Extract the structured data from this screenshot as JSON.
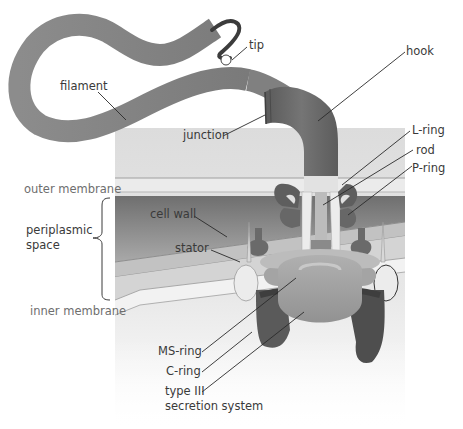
{
  "diagram": {
    "colors": {
      "background": "#ffffff",
      "panel_top": "#d8d8d8",
      "outer_membrane": "#e6e6e6",
      "periplasm_dark": "#7e7e7e",
      "cell_wall_band": "#b8b8b8",
      "inner_membrane": "#eeeeee",
      "filament": "#8a8a8a",
      "hook": "#6a6a6a",
      "ring_dark": "#5c5c5c",
      "rod": "#bdbdbd",
      "stator": "#e8e8e8",
      "ms_ring": "#a8a8a8",
      "c_ring": "#4e4e4e",
      "label_text": "#3a3a3a",
      "side_label_text": "#6e6e6e",
      "leader_line": "#2a2a2a"
    },
    "labels": {
      "tip": "tip",
      "hook": "hook",
      "filament": "filament",
      "junction": "junction",
      "l_ring": "L-ring",
      "rod": "rod",
      "p_ring": "P-ring",
      "outer_membrane": "outer membrane",
      "periplasmic_line1": "periplasmic",
      "periplasmic_line2": "space",
      "cell_wall": "cell wall",
      "stator": "stator",
      "inner_membrane": "inner membrane",
      "ms_ring": "MS-ring",
      "c_ring": "C-ring",
      "type3_line1": "type III",
      "type3_line2": "secretion system"
    }
  }
}
